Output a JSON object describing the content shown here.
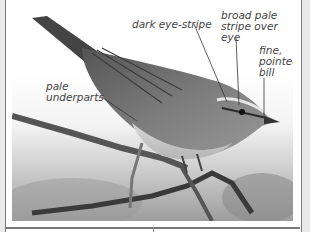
{
  "figure": {
    "annotations": [
      {
        "id": "dark-eye-stripe",
        "text": "dark eye-stripe"
      },
      {
        "id": "broad-pale-stripe",
        "text": "broad pale stripe over eye"
      },
      {
        "id": "fine-pointed-bill",
        "text": "fine, pointed bill"
      },
      {
        "id": "pale-underparts",
        "text": "pale underparts"
      }
    ],
    "lines": {
      "a0": "dark eye-stripe",
      "a1_l1": "broad pale",
      "a1_l2": "stripe over",
      "a1_l3": "eye",
      "a2_l1": "fine,",
      "a2_l2": "pointed",
      "a2_l3": "bill",
      "a3_l1": "pale",
      "a3_l2": "underparts"
    },
    "colors": {
      "border": "#7a7a7a",
      "label": "#444444",
      "background": "#e9e9e9"
    }
  }
}
